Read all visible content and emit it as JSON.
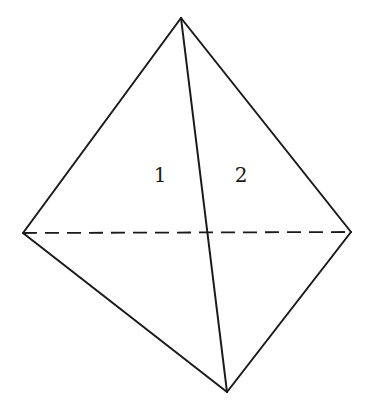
{
  "figure": {
    "type": "tetrahedron",
    "vertices": {
      "apex": [
        181,
        18
      ],
      "left": [
        23,
        233
      ],
      "right": [
        351,
        232
      ],
      "bottom": [
        227,
        392
      ]
    },
    "edges": [
      {
        "from": "apex",
        "to": "left",
        "style": "solid"
      },
      {
        "from": "apex",
        "to": "right",
        "style": "solid"
      },
      {
        "from": "apex",
        "to": "bottom",
        "style": "solid"
      },
      {
        "from": "left",
        "to": "bottom",
        "style": "solid"
      },
      {
        "from": "right",
        "to": "bottom",
        "style": "solid"
      },
      {
        "from": "left",
        "to": "right",
        "style": "dashed"
      }
    ],
    "face_labels": [
      {
        "text": "1",
        "x": 160,
        "y": 182
      },
      {
        "text": "2",
        "x": 241,
        "y": 182
      }
    ]
  }
}
